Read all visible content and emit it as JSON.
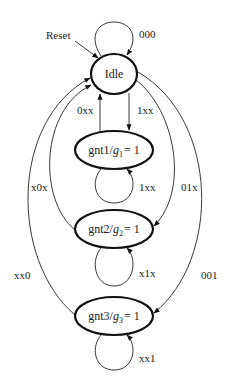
{
  "diagram": {
    "type": "state-machine",
    "reset_label": "Reset",
    "states": [
      {
        "id": "idle",
        "label": "Idle"
      },
      {
        "id": "gnt1",
        "label": "gnt1/",
        "output_var": "g",
        "output_sub": "1",
        "output_val": "= 1"
      },
      {
        "id": "gnt2",
        "label": "gnt2/",
        "output_var": "g",
        "output_sub": "2",
        "output_val": "= 1"
      },
      {
        "id": "gnt3",
        "label": "gnt3/",
        "output_var": "g",
        "output_sub": "3",
        "output_val": "= 1"
      }
    ],
    "transitions": [
      {
        "from": "idle",
        "to": "idle",
        "label": "000"
      },
      {
        "from": "idle",
        "to": "gnt1",
        "label": "1xx"
      },
      {
        "from": "gnt1",
        "to": "idle",
        "label": "0xx"
      },
      {
        "from": "gnt1",
        "to": "gnt1",
        "label": "1xx"
      },
      {
        "from": "idle",
        "to": "gnt2",
        "label": "01x"
      },
      {
        "from": "gnt2",
        "to": "idle",
        "label": "x0x"
      },
      {
        "from": "gnt2",
        "to": "gnt2",
        "label": "x1x"
      },
      {
        "from": "idle",
        "to": "gnt3",
        "label": "001"
      },
      {
        "from": "gnt3",
        "to": "idle",
        "label": "xx0"
      },
      {
        "from": "gnt3",
        "to": "gnt3",
        "label": "xx1"
      }
    ]
  }
}
